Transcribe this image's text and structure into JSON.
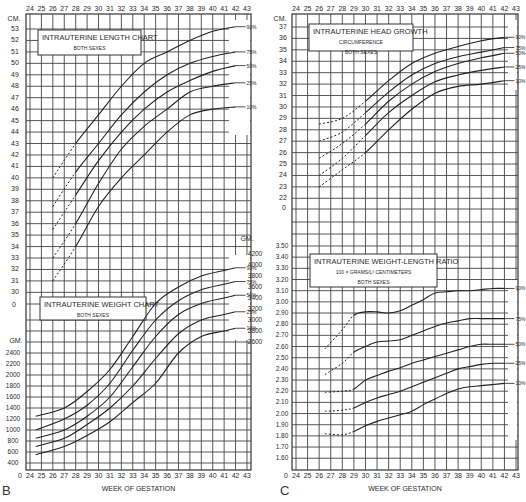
{
  "figure": {
    "panel_labels": [
      "B",
      "C"
    ],
    "x_axis_label": "WEEK OF GESTATION",
    "weeks": [
      24,
      25,
      26,
      27,
      28,
      29,
      30,
      31,
      32,
      33,
      34,
      35,
      36,
      37,
      38,
      39,
      40,
      41,
      42,
      43
    ],
    "percentile_labels": [
      "90%",
      "75%",
      "50%",
      "25%",
      "10%"
    ]
  },
  "chart_data": [
    {
      "type": "line",
      "title": "INTRAUTERINE LENGTH CHART",
      "subtitle": "BOTH SEXES",
      "xlabel": "WEEK OF GESTATION",
      "ylabel": "CM.",
      "ylim": [
        30,
        53
      ],
      "yticks": [
        53,
        52,
        51,
        50,
        49,
        48,
        47,
        46,
        45,
        44,
        43,
        42,
        41,
        40,
        39,
        38,
        37,
        36,
        35,
        34,
        33,
        32,
        31,
        30
      ],
      "x": [
        26,
        28,
        30,
        32,
        34,
        36,
        38,
        40,
        42
      ],
      "dashed_until": 28,
      "series": [
        {
          "name": "90%",
          "values": [
            40,
            43,
            45.5,
            48,
            50,
            51,
            52,
            52.8,
            53.2
          ]
        },
        {
          "name": "75%",
          "values": [
            37.5,
            40.5,
            43,
            45.5,
            47.5,
            49,
            50,
            50.6,
            51
          ]
        },
        {
          "name": "50%",
          "values": [
            35.5,
            38.5,
            41.5,
            44,
            46,
            47.5,
            48.5,
            49.3,
            49.8
          ]
        },
        {
          "name": "25%",
          "values": [
            33,
            36,
            39.5,
            42.5,
            44.5,
            46,
            47.5,
            48,
            48.3
          ]
        },
        {
          "name": "10%",
          "values": [
            31,
            34,
            37.5,
            40,
            42,
            44,
            45.5,
            46,
            46.2
          ]
        }
      ]
    },
    {
      "type": "line",
      "title": "INTRAUTERINE WEIGHT CHART",
      "subtitle": "BOTH SEXES",
      "xlabel": "WEEK OF GESTATION",
      "ylabel": "GM.",
      "ylim": [
        400,
        4200
      ],
      "yticks_left": [
        2400,
        2200,
        2000,
        1800,
        1600,
        1400,
        1200,
        1000,
        800,
        600,
        400
      ],
      "yticks_right": [
        4200,
        4000,
        3800,
        3600,
        3400,
        3200,
        3000,
        2800,
        2600
      ],
      "x": [
        24.5,
        27,
        29,
        31,
        33,
        35,
        37,
        39,
        41,
        42
      ],
      "series": [
        {
          "name": "90%",
          "values": [
            1250,
            1400,
            1700,
            2100,
            2700,
            3300,
            3600,
            3800,
            3900,
            3950
          ]
        },
        {
          "name": "75%",
          "values": [
            1000,
            1200,
            1450,
            1850,
            2450,
            3000,
            3350,
            3550,
            3650,
            3700
          ]
        },
        {
          "name": "50%",
          "values": [
            850,
            1000,
            1250,
            1600,
            2150,
            2700,
            3100,
            3300,
            3400,
            3450
          ]
        },
        {
          "name": "25%",
          "values": [
            700,
            850,
            1100,
            1400,
            1800,
            2300,
            2750,
            3000,
            3100,
            3150
          ]
        },
        {
          "name": "10%",
          "values": [
            550,
            700,
            900,
            1150,
            1500,
            1850,
            2400,
            2700,
            2800,
            2850
          ]
        }
      ]
    },
    {
      "type": "line",
      "title": "INTRAUTERINE HEAD GROWTH",
      "subtitle": "CIRCUMFERENCE",
      "subtitle2": "BOTH SEXES",
      "xlabel": "WEEK OF GESTATION",
      "ylabel": "CM.",
      "ylim": [
        22,
        37
      ],
      "yticks": [
        37,
        36,
        35,
        34,
        33,
        32,
        31,
        30,
        29,
        28,
        27,
        26,
        25,
        24,
        23,
        22
      ],
      "x": [
        26,
        28,
        30,
        32,
        34,
        36,
        38,
        40,
        42
      ],
      "dashed_until": 29,
      "series": [
        {
          "name": "90%",
          "values": [
            28.5,
            29,
            30.5,
            32.3,
            33.8,
            34.7,
            35.3,
            35.8,
            36.1
          ]
        },
        {
          "name": "75%",
          "values": [
            27,
            27.8,
            29.5,
            31.3,
            32.8,
            33.8,
            34.4,
            34.8,
            35.2
          ]
        },
        {
          "name": "50%",
          "values": [
            25.5,
            26.8,
            28.5,
            30.5,
            32,
            33.1,
            33.8,
            34.3,
            34.7
          ]
        },
        {
          "name": "25%",
          "values": [
            24,
            25.5,
            27.5,
            29.5,
            31,
            32.2,
            32.8,
            33.2,
            33.5
          ]
        },
        {
          "name": "10%",
          "values": [
            23,
            24.5,
            26,
            28,
            29.8,
            31.2,
            31.8,
            32,
            32.3
          ]
        }
      ]
    },
    {
      "type": "line",
      "title": "INTRAUTERINE WEIGHT-LENGTH RATIO",
      "subtitle": "100 × GRAMS/L³ CENTIMETERS",
      "subtitle2": "BOTH SEXES",
      "xlabel": "WEEK OF GESTATION",
      "ylabel": "",
      "ylim": [
        1.6,
        3.5
      ],
      "yticks": [
        "3.50",
        "3.40",
        "3.30",
        "3.20",
        "3.10",
        "3.00",
        "2.90",
        "2.80",
        "2.70",
        "2.60",
        "2.50",
        "2.40",
        "2.30",
        "2.20",
        "2.10",
        "2.00",
        "1.90",
        "1.80",
        "1.70",
        "1.60"
      ],
      "x": [
        26.5,
        28,
        29,
        30,
        31,
        32,
        33,
        34,
        35,
        36,
        37,
        38,
        39,
        40,
        41,
        42
      ],
      "dashed_until": 29,
      "series": [
        {
          "name": "90%",
          "values": [
            2.58,
            2.75,
            2.88,
            2.91,
            2.91,
            2.9,
            2.92,
            2.97,
            3.02,
            3.08,
            3.09,
            3.1,
            3.1,
            3.11,
            3.12,
            3.12
          ]
        },
        {
          "name": "75%",
          "values": [
            2.35,
            2.45,
            2.55,
            2.6,
            2.64,
            2.65,
            2.66,
            2.7,
            2.74,
            2.78,
            2.81,
            2.83,
            2.85,
            2.85,
            2.85,
            2.85
          ]
        },
        {
          "name": "50%",
          "values": [
            2.19,
            2.2,
            2.22,
            2.3,
            2.34,
            2.38,
            2.41,
            2.45,
            2.48,
            2.51,
            2.54,
            2.57,
            2.6,
            2.62,
            2.62,
            2.62
          ]
        },
        {
          "name": "25%",
          "values": [
            2.02,
            2.03,
            2.05,
            2.1,
            2.14,
            2.17,
            2.2,
            2.24,
            2.28,
            2.32,
            2.36,
            2.4,
            2.42,
            2.44,
            2.45,
            2.45
          ]
        },
        {
          "name": "10%",
          "values": [
            1.82,
            1.81,
            1.84,
            1.89,
            1.93,
            1.96,
            1.99,
            2.02,
            2.08,
            2.13,
            2.18,
            2.22,
            2.24,
            2.25,
            2.26,
            2.27
          ]
        }
      ]
    }
  ]
}
